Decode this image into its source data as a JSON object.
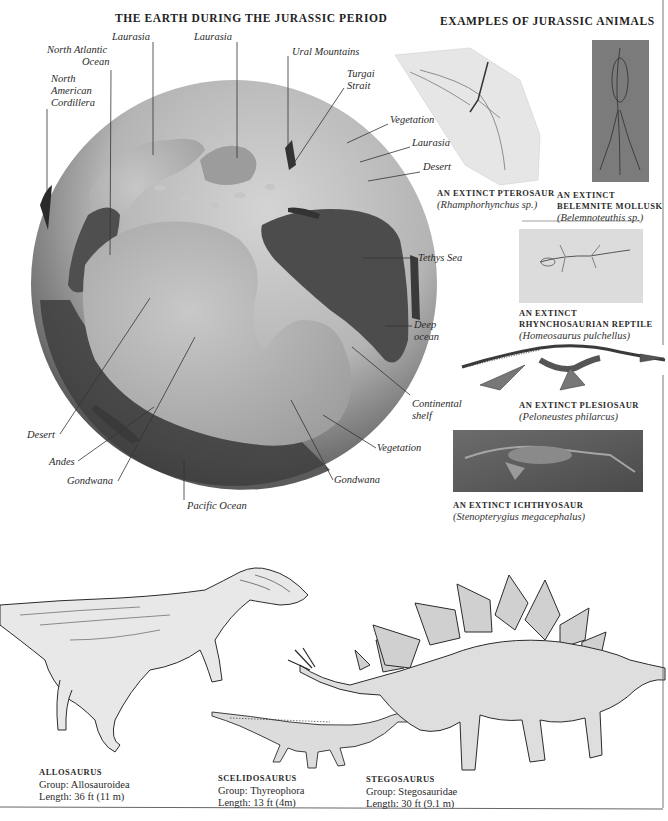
{
  "page": {
    "section_left_title": "THE EARTH DURING THE JURASSIC PERIOD",
    "section_right_title": "EXAMPLES OF JURASSIC ANIMALS"
  },
  "globe_labels": {
    "laurasia_1": "Laurasia",
    "laurasia_2": "Laurasia",
    "north_atlantic_line1": "North Atlantic",
    "north_atlantic_line2": "Ocean",
    "nac_line1": "North",
    "nac_line2": "American",
    "nac_line3": "Cordillera",
    "ural": "Ural Mountains",
    "turgai_line1": "Turgai",
    "turgai_line2": "Strait",
    "vegetation_1": "Vegetation",
    "laurasia_3": "Laurasia",
    "desert_1": "Desert",
    "tethys": "Tethys Sea",
    "deep_line1": "Deep",
    "deep_line2": "ocean",
    "continental_line1": "Continental",
    "continental_line2": "shelf",
    "vegetation_2": "Vegetation",
    "gondwana_1": "Gondwana",
    "pacific": "Pacific Ocean",
    "gondwana_2": "Gondwana",
    "andes": "Andes",
    "desert_2": "Desert"
  },
  "fossils": [
    {
      "id": "pterosaur",
      "title_lines": [
        "AN EXTINCT PTEROSAUR"
      ],
      "scientific": "(Rhamphorhynchus sp.)"
    },
    {
      "id": "belemnite",
      "title_lines": [
        "AN EXTINCT",
        "BELEMNITE MOLLUSK"
      ],
      "scientific": "(Belemnoteuthis sp.)"
    },
    {
      "id": "rhynchosaur",
      "title_lines": [
        "AN EXTINCT",
        "RHYNCHOSAURIAN REPTILE"
      ],
      "scientific": "(Homeosaurus pulchellus)"
    },
    {
      "id": "plesiosaur",
      "title_lines": [
        "AN EXTINCT PLESIOSAUR"
      ],
      "scientific": "(Peloneustes philarcus)"
    },
    {
      "id": "ichthyosaur",
      "title_lines": [
        "AN EXTINCT ICHTHYOSAUR"
      ],
      "scientific": "(Stenopterygius megacephalus)"
    }
  ],
  "dinosaurs": [
    {
      "name": "ALLOSAURUS",
      "group": "Group: Allosauroidea",
      "length": "Length: 36 ft (11 m)"
    },
    {
      "name": "SCELIDOSAURUS",
      "group": "Group: Thyreophora",
      "length": "Length: 13 ft (4m)"
    },
    {
      "name": "STEGOSAURUS",
      "group": "Group: Stegosauridae",
      "length": "Length: 30 ft (9.1 m)"
    }
  ],
  "colors": {
    "ocean": "#4f4f4f",
    "shelf": "#b9b9b9",
    "land": "#a8a8a8",
    "rule": "#555555"
  }
}
